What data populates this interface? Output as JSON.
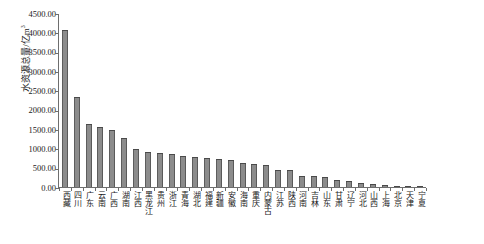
{
  "chart_data": {
    "type": "bar",
    "title": "",
    "xlabel": "",
    "ylabel": "水资源总量/亿m³",
    "ylabel_text": "水资源总量/亿m",
    "ylabel_exponent": "3",
    "ylim": [
      0,
      4500
    ],
    "ytick_labels": [
      "4500.00",
      "4000.00",
      "3500.00",
      "3000.00",
      "2500.00",
      "2000.00",
      "1500.00",
      "1000.00",
      "500.00",
      "0.00"
    ],
    "ytick_values": [
      4500,
      4000,
      3500,
      3000,
      2500,
      2000,
      1500,
      1000,
      500,
      0
    ],
    "grid": false,
    "legend": "none",
    "bar_color": "#8c8c8c",
    "bar_edge_color": "#4a4a4a",
    "axis_color": "#6e6e6e",
    "categories": [
      "西藏",
      "四川",
      "广东",
      "云南",
      "广西",
      "湖南",
      "江西",
      "黑龙江",
      "贵州",
      "浙江",
      "青海",
      "湖北",
      "福建",
      "新疆",
      "安徽",
      "海南",
      "重庆",
      "内蒙古",
      "江苏",
      "陕西",
      "河南",
      "吉林",
      "山东",
      "甘肃",
      "辽宁",
      "河北",
      "山西",
      "上海",
      "北京",
      "天津",
      "宁夏"
    ],
    "values": [
      4080,
      2350,
      1640,
      1560,
      1480,
      1280,
      1000,
      920,
      880,
      850,
      800,
      790,
      760,
      740,
      700,
      620,
      600,
      560,
      440,
      430,
      290,
      280,
      250,
      190,
      150,
      110,
      80,
      45,
      30,
      18,
      10
    ]
  }
}
